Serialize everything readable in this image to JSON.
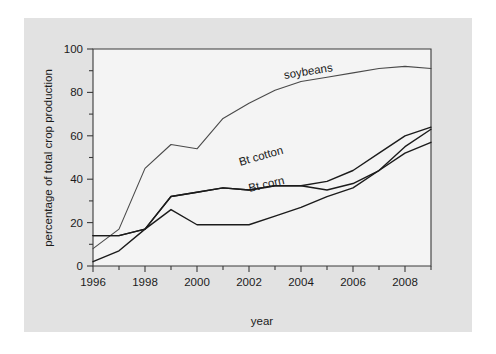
{
  "figure": {
    "background_color": "#e2e2e2",
    "plot_background_color": "#f4f4f4",
    "page_background_color": "#ffffff"
  },
  "chart_data": {
    "type": "line",
    "title": "",
    "xlabel": "year",
    "ylabel": "percentage of total crop production",
    "xlim": [
      1996,
      2009
    ],
    "ylim": [
      0,
      100
    ],
    "xticks": [
      1996,
      1998,
      2000,
      2002,
      2004,
      2006,
      2008
    ],
    "xtick_labels": [
      "1996",
      "1998",
      "2000",
      "2002",
      "2004",
      "2006",
      "2008"
    ],
    "xminor_ticks": [
      1997,
      1999,
      2001,
      2003,
      2005,
      2007,
      2009
    ],
    "yticks": [
      0,
      20,
      40,
      60,
      80,
      100
    ],
    "ytick_labels": [
      "0",
      "20",
      "40",
      "60",
      "80",
      "100"
    ],
    "yminor_ticks": [
      10,
      30,
      50,
      70,
      90
    ],
    "grid": false,
    "legend_position": "inline-annotations",
    "x": [
      1996,
      1997,
      1998,
      1999,
      2000,
      2001,
      2002,
      2003,
      2004,
      2005,
      2006,
      2007,
      2008,
      2009
    ],
    "series": [
      {
        "name": "soybeans",
        "label": "soybeans",
        "color": "#4a4a4a",
        "stroke_width": 1.1,
        "label_x": 2004.3,
        "label_y": 88,
        "label_rotation": -9,
        "values": [
          8,
          17,
          45,
          56,
          54,
          68,
          75,
          81,
          85,
          87,
          89,
          91,
          92,
          91
        ]
      },
      {
        "name": "bt_cotton",
        "label": "Bt cotton",
        "color": "#1b1b1b",
        "stroke_width": 1.4,
        "label_x": 2002.5,
        "label_y": 49,
        "label_rotation": -16,
        "values": [
          14,
          14,
          17,
          32,
          34,
          36,
          35,
          37,
          37,
          35,
          38,
          44,
          52,
          57
        ]
      },
      {
        "name": "bt_corn",
        "label": "Bt corn",
        "color": "#1b1b1b",
        "stroke_width": 1.4,
        "label_x": 2002.7,
        "label_y": 36,
        "label_rotation": -13,
        "values": [
          2,
          7,
          17,
          26,
          19,
          19,
          19,
          23,
          27,
          32,
          36,
          44,
          55,
          63
        ]
      }
    ],
    "series_upper": [
      {
        "name": "bt_cotton_upper",
        "values": [
          14,
          14,
          17,
          32,
          34,
          36,
          35,
          37,
          37,
          39,
          44,
          52,
          60,
          64
        ]
      }
    ]
  }
}
